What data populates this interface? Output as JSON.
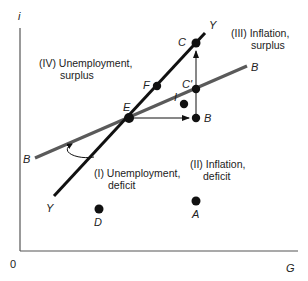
{
  "diagram": {
    "axes": {
      "y_label": "i",
      "x_label": "G",
      "origin_label": "0"
    },
    "curves": [
      {
        "name": "YY",
        "label_start": "Y",
        "label_end": "Y",
        "color": "#111111"
      },
      {
        "name": "BB",
        "label_start": "B",
        "label_end": "B",
        "color": "#5a5a5a"
      }
    ],
    "points": {
      "E": "E",
      "F": "F",
      "C": "C",
      "C_prime": "C'",
      "I": "I",
      "B": "B",
      "A": "A",
      "D": "D"
    },
    "regions": {
      "I": {
        "line1": "(I) Unemployment,",
        "line2": "deficit"
      },
      "II": {
        "line1": "(II) Inflation,",
        "line2": "deficit"
      },
      "III": {
        "line1": "(III) Inflation,",
        "line2": "surplus"
      },
      "IV": {
        "line1": "(IV) Unemployment,",
        "line2": "surplus"
      }
    }
  }
}
